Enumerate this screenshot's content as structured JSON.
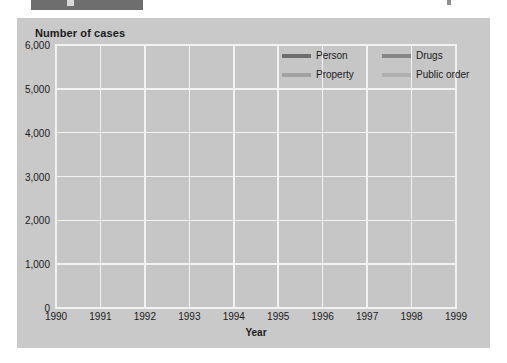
{
  "page": {
    "header_fragment_visible": true
  },
  "chart": {
    "y_axis_title": "Number of cases",
    "x_axis_title": "Year",
    "y_ticks": [
      "0",
      "1,000",
      "2,000",
      "3,000",
      "4,000",
      "5,000",
      "6,000"
    ],
    "x_ticks": [
      "1990",
      "1991",
      "1992",
      "1993",
      "1994",
      "1995",
      "1996",
      "1997",
      "1998",
      "1999"
    ],
    "legend": [
      {
        "label": "Person",
        "color": "#6d6d6d"
      },
      {
        "label": "Drugs",
        "color": "#868686"
      },
      {
        "label": "Property",
        "color": "#a2a2a2"
      },
      {
        "label": "Public order",
        "color": "#b0b0b0"
      }
    ],
    "panel_color": "#c9c9c9",
    "plot_color": "#c6c6c6",
    "grid_color": "#f2f2f2"
  },
  "chart_data": {
    "type": "line",
    "title": "",
    "xlabel": "Year",
    "ylabel": "Number of cases",
    "x": [
      1990,
      1991,
      1992,
      1993,
      1994,
      1995,
      1996,
      1997,
      1998,
      1999
    ],
    "ylim": [
      0,
      6000
    ],
    "ytick_step": 1000,
    "grid": true,
    "legend_position": "top-right inside plot",
    "series": [
      {
        "name": "Person",
        "color": "#6d6d6d",
        "values": [
          2650,
          3650,
          4100,
          4650,
          5150,
          4850,
          4450,
          3250,
          2900,
          2500
        ]
      },
      {
        "name": "Drugs",
        "color": "#868686",
        "values": [
          1300,
          1850,
          1250,
          1250,
          1300,
          1200,
          1400,
          1300,
          1300,
          1200
        ]
      },
      {
        "name": "Property",
        "color": "#a2a2a2",
        "values": [
          3850,
          4600,
          4250,
          4150,
          4300,
          3300,
          3700,
          3200,
          3300,
          3000
        ]
      },
      {
        "name": "Public order",
        "color": "#b0b0b0",
        "values": [
          700,
          800,
          900,
          1000,
          1000,
          750,
          700,
          700,
          650,
          900
        ]
      }
    ]
  }
}
